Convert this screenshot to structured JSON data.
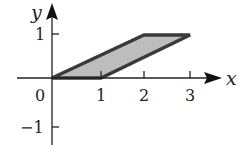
{
  "diagram": {
    "type": "coordinate-plane-region",
    "axes": {
      "x_label": "x",
      "y_label": "y",
      "origin_label": "0",
      "x_ticks": [
        {
          "value": 1,
          "label": "1"
        },
        {
          "value": 2,
          "label": "2"
        },
        {
          "value": 3,
          "label": "3"
        }
      ],
      "y_ticks": [
        {
          "value": 1,
          "label": "1"
        },
        {
          "value": -1,
          "label": "−1"
        }
      ]
    },
    "region": {
      "shape": "parallelogram",
      "vertices": [
        [
          0,
          0
        ],
        [
          1,
          0
        ],
        [
          3,
          1
        ],
        [
          2,
          1
        ]
      ],
      "fill_color": "#bdbdbd",
      "stroke_color": "#3a3a3a"
    }
  }
}
